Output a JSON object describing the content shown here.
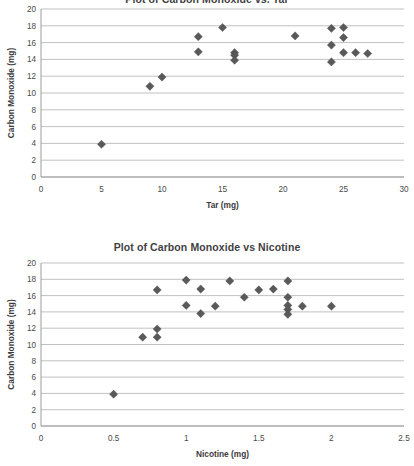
{
  "page": {
    "background": "#ffffff",
    "marker_color": "#595959",
    "gridline_color": "#a6a6a6",
    "axis_color": "#9c9c9c"
  },
  "chart_data": [
    {
      "id": "carbon-monoxide-vs-tar",
      "type": "scatter",
      "title": "Plot of Carbon Monoxide vs. Tar",
      "xlabel": "Tar (mg)",
      "ylabel": "Carbon Monoxide (mg)",
      "xlim": [
        0,
        30
      ],
      "ylim": [
        0,
        20
      ],
      "xticks": [
        0,
        5,
        10,
        15,
        20,
        25,
        30
      ],
      "yticks": [
        0,
        2,
        4,
        6,
        8,
        10,
        12,
        14,
        16,
        18,
        20
      ],
      "xtick_labels": [
        "0",
        "5",
        "10",
        "15",
        "20",
        "25",
        "30"
      ],
      "ytick_labels": [
        "0",
        "2",
        "4",
        "6",
        "8",
        "10",
        "12",
        "14",
        "16",
        "18",
        "20"
      ],
      "grid": "horizontal",
      "legend": "none",
      "points": [
        {
          "x": 5.0,
          "y": 3.9
        },
        {
          "x": 9.0,
          "y": 10.8
        },
        {
          "x": 10.0,
          "y": 11.9
        },
        {
          "x": 13.0,
          "y": 16.7
        },
        {
          "x": 13.0,
          "y": 14.9
        },
        {
          "x": 15.0,
          "y": 17.8
        },
        {
          "x": 16.0,
          "y": 14.8
        },
        {
          "x": 16.0,
          "y": 14.5
        },
        {
          "x": 16.0,
          "y": 13.9
        },
        {
          "x": 21.0,
          "y": 16.8
        },
        {
          "x": 24.0,
          "y": 17.7
        },
        {
          "x": 24.0,
          "y": 15.7
        },
        {
          "x": 24.0,
          "y": 13.7
        },
        {
          "x": 25.0,
          "y": 17.8
        },
        {
          "x": 25.0,
          "y": 16.6
        },
        {
          "x": 25.0,
          "y": 14.8
        },
        {
          "x": 26.0,
          "y": 14.8
        },
        {
          "x": 27.0,
          "y": 14.7
        }
      ]
    },
    {
      "id": "carbon-monoxide-vs-nicotine",
      "type": "scatter",
      "title": "Plot of Carbon Monoxide vs Nicotine",
      "xlabel": "Nicotine (mg)",
      "ylabel": "Carbon Monoxide (mg)",
      "xlim": [
        0,
        2.5
      ],
      "ylim": [
        0,
        20
      ],
      "xticks": [
        0,
        0.5,
        1,
        1.5,
        2,
        2.5
      ],
      "yticks": [
        0,
        2,
        4,
        6,
        8,
        10,
        12,
        14,
        16,
        18,
        20
      ],
      "xtick_labels": [
        "0",
        "0.5",
        "1",
        "1.5",
        "2",
        "2.5"
      ],
      "ytick_labels": [
        "0",
        "2",
        "4",
        "6",
        "8",
        "10",
        "12",
        "14",
        "16",
        "18",
        "20"
      ],
      "grid": "horizontal",
      "legend": "none",
      "points": [
        {
          "x": 0.5,
          "y": 3.9
        },
        {
          "x": 0.7,
          "y": 10.9
        },
        {
          "x": 0.8,
          "y": 11.9
        },
        {
          "x": 0.8,
          "y": 10.9
        },
        {
          "x": 0.8,
          "y": 16.7
        },
        {
          "x": 1.0,
          "y": 17.9
        },
        {
          "x": 1.0,
          "y": 14.8
        },
        {
          "x": 1.1,
          "y": 16.8
        },
        {
          "x": 1.1,
          "y": 13.8
        },
        {
          "x": 1.2,
          "y": 14.7
        },
        {
          "x": 1.3,
          "y": 17.8
        },
        {
          "x": 1.4,
          "y": 15.8
        },
        {
          "x": 1.5,
          "y": 16.7
        },
        {
          "x": 1.6,
          "y": 16.8
        },
        {
          "x": 1.7,
          "y": 17.8
        },
        {
          "x": 1.7,
          "y": 15.8
        },
        {
          "x": 1.7,
          "y": 14.8
        },
        {
          "x": 1.7,
          "y": 14.3
        },
        {
          "x": 1.7,
          "y": 13.7
        },
        {
          "x": 1.8,
          "y": 14.7
        },
        {
          "x": 2.0,
          "y": 14.7
        }
      ]
    }
  ]
}
